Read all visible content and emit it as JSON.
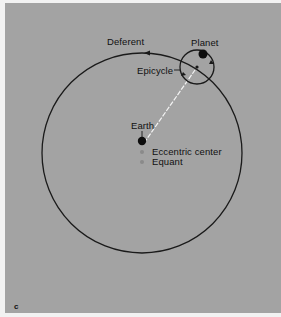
{
  "figure": {
    "panel_letter": "c",
    "background_color": "#a3a3a3",
    "labels": {
      "deferent": "Deferent",
      "planet": "Planet",
      "epicycle": "Epicycle",
      "earth": "Earth",
      "eccentric_center": "Eccentric center",
      "equant": "Equant"
    },
    "elements": {
      "deferent_circle": {
        "cx": 142,
        "cy": 153,
        "r": 100
      },
      "epicycle_circle": {
        "cx": 197,
        "cy": 67,
        "r": 17
      },
      "planet": {
        "cx": 203,
        "cy": 54,
        "r": 4.5
      },
      "earth": {
        "cx": 142,
        "cy": 141,
        "r": 4.2
      },
      "eccentric_center_dot": {
        "cx": 142,
        "cy": 152,
        "r": 2
      },
      "equant_dot": {
        "cx": 142,
        "cy": 162,
        "r": 2
      },
      "line_of_sight": {
        "x1": 144,
        "y1": 143,
        "x2": 195,
        "y2": 70,
        "style": "dashed",
        "color": "#f4f4f4"
      }
    }
  }
}
